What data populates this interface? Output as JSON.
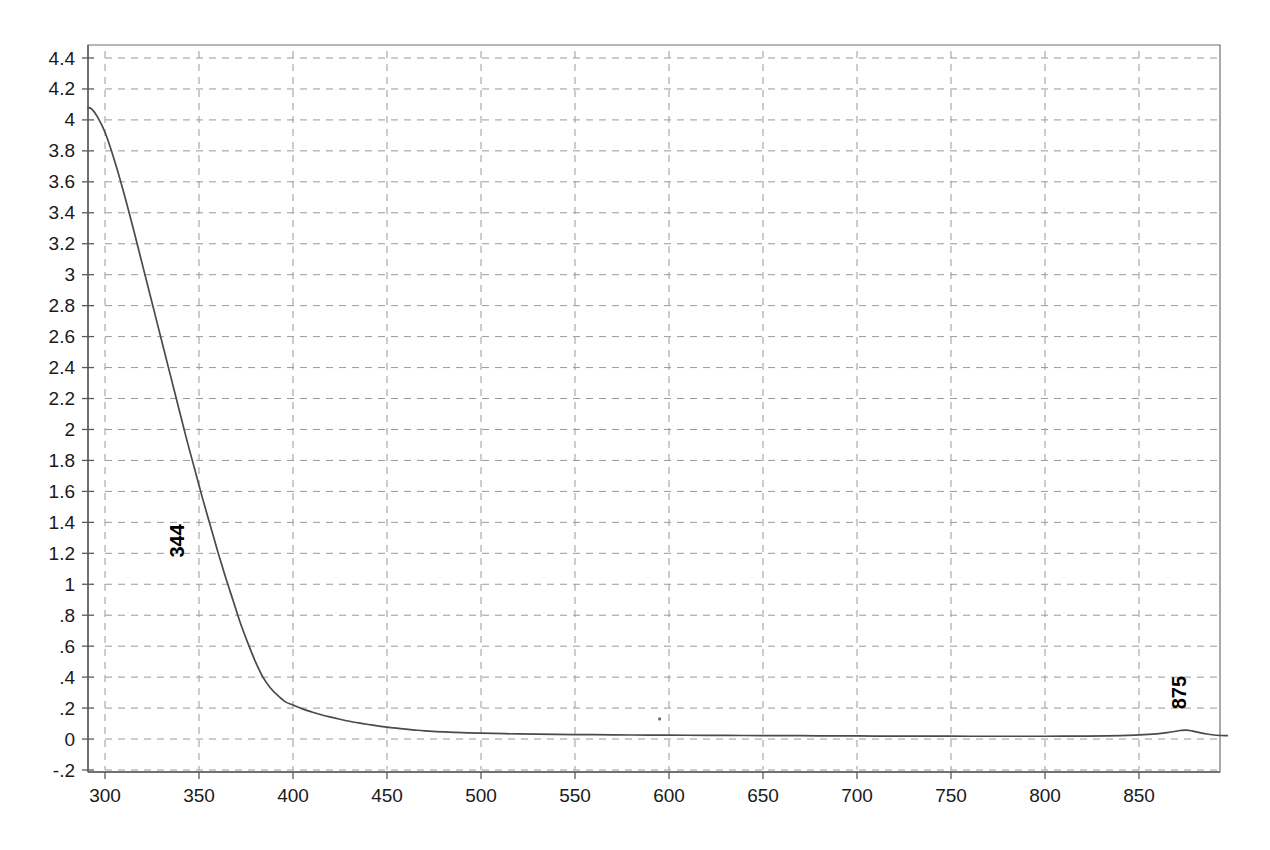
{
  "chart_data": {
    "type": "line",
    "title": "",
    "subtitle": "",
    "xlabel": "",
    "ylabel": "",
    "xlim": [
      291,
      897
    ],
    "ylim": [
      -0.2,
      4.4
    ],
    "grid": true,
    "legend": "none",
    "x_ticks": [
      300,
      350,
      400,
      450,
      500,
      550,
      600,
      650,
      700,
      750,
      800,
      850
    ],
    "x_tick_labels": [
      "300",
      "350",
      "400",
      "450",
      "500",
      "550",
      "600",
      "650",
      "700",
      "750",
      "800",
      "850"
    ],
    "y_ticks": [
      4.4,
      4.2,
      4,
      3.8,
      3.6,
      3.4,
      3.2,
      3,
      2.8,
      2.6,
      2.4,
      2.2,
      2,
      1.8,
      1.6,
      1.4,
      1.2,
      1,
      0.8,
      0.6,
      0.4,
      0.2,
      0,
      -0.2
    ],
    "y_tick_labels": [
      "4.4",
      "4.2",
      "4",
      "3.8",
      "3.6",
      "3.4",
      "3.2",
      "3",
      "2.8",
      "2.6",
      "2.4",
      "2.2",
      "2",
      "1.8",
      "1.6",
      "1.4",
      "1.2",
      "1",
      ".8",
      ".6",
      ".4",
      ".2",
      "0",
      "-.2"
    ],
    "series": [
      {
        "name": "absorbance",
        "color": "#4a4a4a",
        "x": [
          291,
          293,
          296,
          300,
          305,
          310,
          315,
          320,
          325,
          330,
          335,
          340,
          344,
          348,
          352,
          356,
          360,
          364,
          368,
          372,
          376,
          380,
          384,
          388,
          392,
          396,
          400,
          405,
          410,
          415,
          420,
          425,
          430,
          435,
          440,
          445,
          450,
          455,
          460,
          465,
          470,
          480,
          490,
          500,
          520,
          540,
          560,
          580,
          600,
          620,
          640,
          660,
          680,
          700,
          720,
          740,
          760,
          780,
          800,
          820,
          840,
          855,
          865,
          872,
          875,
          878,
          885,
          890,
          897
        ],
        "y": [
          4.08,
          4.07,
          4.02,
          3.92,
          3.74,
          3.53,
          3.3,
          3.06,
          2.82,
          2.58,
          2.34,
          2.1,
          1.91,
          1.73,
          1.55,
          1.38,
          1.21,
          1.05,
          0.9,
          0.75,
          0.62,
          0.5,
          0.4,
          0.33,
          0.28,
          0.24,
          0.22,
          0.195,
          0.175,
          0.157,
          0.142,
          0.128,
          0.115,
          0.104,
          0.094,
          0.085,
          0.077,
          0.07,
          0.064,
          0.058,
          0.053,
          0.046,
          0.041,
          0.038,
          0.033,
          0.03,
          0.028,
          0.026,
          0.025,
          0.024,
          0.023,
          0.022,
          0.021,
          0.02,
          0.019,
          0.019,
          0.018,
          0.018,
          0.018,
          0.019,
          0.022,
          0.03,
          0.042,
          0.055,
          0.058,
          0.053,
          0.035,
          0.026,
          0.022
        ]
      }
    ],
    "annotations": [
      {
        "label": "344",
        "x": 344,
        "y": 1.91,
        "rotation": -90,
        "text_x": 342,
        "text_y": 1.28
      },
      {
        "label": "875",
        "x": 875,
        "y": 0.058,
        "rotation": -90,
        "text_x": 875,
        "text_y": 0.3
      }
    ],
    "artifacts": [
      {
        "name": "speck",
        "x": 595,
        "y": 0.13
      }
    ]
  }
}
